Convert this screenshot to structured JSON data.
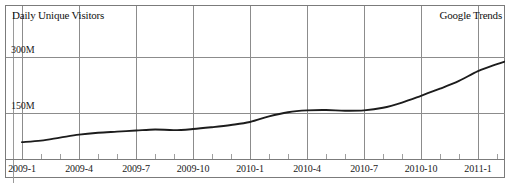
{
  "chart_data": {
    "type": "line",
    "title": "Daily Unique Visitors",
    "source_label": "Google Trends",
    "xlabel": "",
    "ylabel": "Daily Unique Visitors",
    "grid": true,
    "legend": "none",
    "xlim": [
      "2009-1",
      "2011-4"
    ],
    "ylim": [
      0,
      375
    ],
    "y_unit": "M",
    "y_ticks": [
      {
        "value": 300,
        "label": "300M"
      },
      {
        "value": 150,
        "label": "150M"
      }
    ],
    "x_ticks": [
      "2009-1",
      "2009-4",
      "2009-7",
      "2009-10",
      "2010-1",
      "2010-4",
      "2010-7",
      "2010-10",
      "2011-1"
    ],
    "x_minor_ticks_per_interval": 3,
    "series": [
      {
        "name": "Daily Unique Visitors",
        "color": "#1c1c1c",
        "x": [
          "2009-01",
          "2009-02",
          "2009-03",
          "2009-04",
          "2009-05",
          "2009-06",
          "2009-07",
          "2009-08",
          "2009-09",
          "2009-10",
          "2009-11",
          "2009-12",
          "2010-01",
          "2010-02",
          "2010-03",
          "2010-04",
          "2010-05",
          "2010-06",
          "2010-07",
          "2010-08",
          "2010-09",
          "2010-10",
          "2010-11",
          "2010-12",
          "2011-01",
          "2011-02",
          "2011-03",
          "2011-04"
        ],
        "values": [
          72,
          76,
          84,
          92,
          97,
          100,
          103,
          106,
          104,
          107,
          112,
          118,
          126,
          141,
          152,
          157,
          158,
          156,
          157,
          164,
          178,
          196,
          215,
          236,
          262,
          281,
          298,
          322
        ]
      }
    ],
    "annotations": []
  }
}
